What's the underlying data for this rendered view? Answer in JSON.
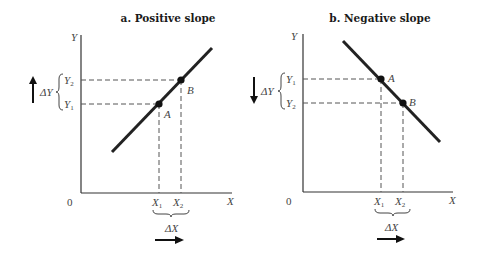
{
  "panels": [
    {
      "id": "a",
      "title": "a. Positive slope",
      "y_axis_label": "Y",
      "x_axis_label": "X",
      "origin_label": "0",
      "y_ticks": [
        {
          "base": "Y",
          "sub": "2"
        },
        {
          "base": "Y",
          "sub": "1"
        }
      ],
      "x_ticks": [
        {
          "base": "X",
          "sub": "1"
        },
        {
          "base": "X",
          "sub": "2"
        }
      ],
      "points": [
        "A",
        "B"
      ],
      "delta_y_label": "ΔY",
      "delta_x_label": "ΔX",
      "delta_y_direction": "up",
      "delta_x_direction": "right",
      "slope": "positive"
    },
    {
      "id": "b",
      "title": "b. Negative slope",
      "y_axis_label": "Y",
      "x_axis_label": "X",
      "origin_label": "0",
      "y_ticks": [
        {
          "base": "Y",
          "sub": "1"
        },
        {
          "base": "Y",
          "sub": "2"
        }
      ],
      "x_ticks": [
        {
          "base": "X",
          "sub": "1"
        },
        {
          "base": "X",
          "sub": "2"
        }
      ],
      "points": [
        "A",
        "B"
      ],
      "delta_y_label": "ΔY",
      "delta_x_label": "ΔX",
      "delta_y_direction": "down",
      "delta_x_direction": "right",
      "slope": "negative"
    }
  ]
}
